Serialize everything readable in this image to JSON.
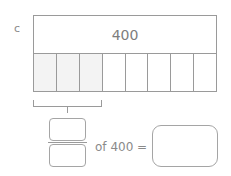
{
  "question": {
    "label": "c",
    "whole_value": "400",
    "parts_total": 8,
    "parts_shaded": 3,
    "parts": [
      {
        "shaded": true
      },
      {
        "shaded": true
      },
      {
        "shaded": true
      },
      {
        "shaded": false
      },
      {
        "shaded": false
      },
      {
        "shaded": false
      },
      {
        "shaded": false
      },
      {
        "shaded": false
      }
    ],
    "fraction": {
      "numerator_value": "",
      "denominator_value": ""
    },
    "equation_text": "of 400 =",
    "answer_value": ""
  },
  "colors": {
    "line": "#9a9a9a",
    "shaded": "#f3f3f3",
    "text": "#7a7a7a"
  }
}
